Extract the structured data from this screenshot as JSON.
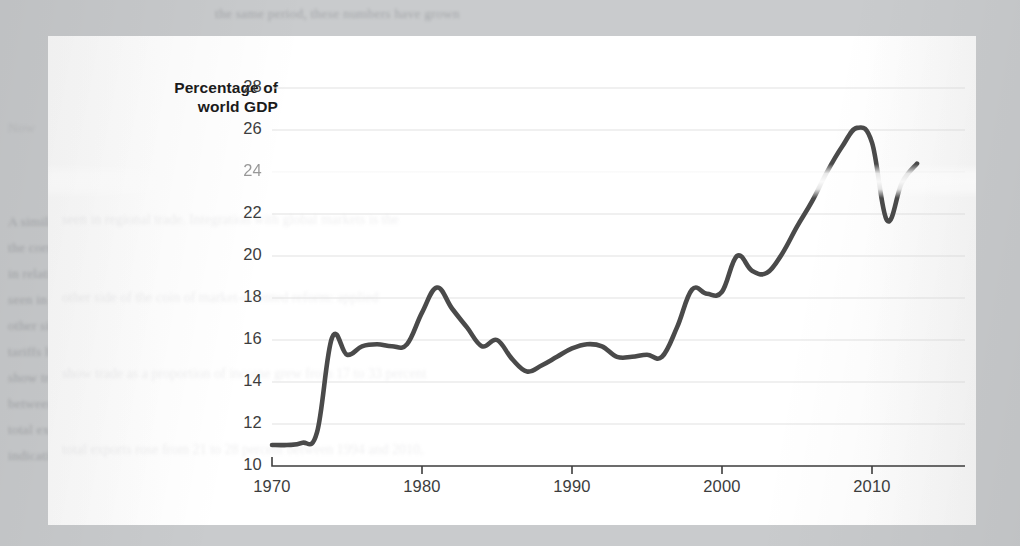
{
  "figure": {
    "y_axis_title_line1": "Percentage of",
    "y_axis_title_line2": "world GDP",
    "line_color": "#4a4a4a",
    "grid_color": "#e2e2e2",
    "axis_color": "#3d3d3d",
    "card_color": "#fdfdfd",
    "page_color": "#c9cbcd"
  },
  "page_text": {
    "line_top": "the same period, these numbers have grown",
    "line_right_1": "economies",
    "line_left_1": "Now",
    "line_body_1": "A similar story holds for",
    "line_body_2": "the corresponding figure",
    "line_body_3": "in relative terms to these",
    "line_body_4": "seen in regional trade. Integration with global markets is the",
    "line_body_5": "other side of the coin of market-oriented reform: applied",
    "line_body_6": "tariffs have fallen and export volumes have grown. Calculations",
    "line_body_7": "show trade as a proportion of income grew from 17 to 33 percent",
    "line_body_8": "between 1990 and 2010, while the share of intermediate inputs in",
    "line_body_9": "total exports rose from 21 to 28 percent between 1994 and 2010,",
    "line_body_10": "indicating much greater integration into global value chains."
  },
  "chart_data": {
    "type": "line",
    "title": "",
    "xlabel": "",
    "ylabel": "Percentage of world GDP",
    "xlim": [
      1970,
      2013
    ],
    "ylim": [
      10,
      28
    ],
    "yticks": [
      10,
      12,
      14,
      16,
      18,
      20,
      22,
      24,
      26,
      28
    ],
    "xticks": [
      1970,
      1980,
      1990,
      2000,
      2010
    ],
    "ytick_labels": [
      "10",
      "12",
      "14",
      "16",
      "18",
      "20",
      "22",
      "24",
      "26",
      "28"
    ],
    "xtick_labels": [
      "1970",
      "1980",
      "1990",
      "2000",
      "2010"
    ],
    "grid": "horizontal",
    "legend": "none",
    "series": [
      {
        "name": "Percentage of world GDP",
        "x": [
          1970,
          1971,
          1972,
          1973,
          1974,
          1975,
          1976,
          1977,
          1978,
          1979,
          1980,
          1981,
          1982,
          1983,
          1984,
          1985,
          1986,
          1987,
          1988,
          1989,
          1990,
          1991,
          1992,
          1993,
          1994,
          1995,
          1996,
          1997,
          1998,
          1999,
          2000,
          2001,
          2002,
          2003,
          2004,
          2005,
          2006,
          2007,
          2008,
          2009,
          2010,
          2011,
          2012,
          2013
        ],
        "values": [
          11.0,
          11.0,
          11.1,
          11.6,
          16.1,
          15.3,
          15.7,
          15.8,
          15.7,
          15.8,
          17.3,
          18.5,
          17.5,
          16.6,
          15.7,
          16.0,
          15.1,
          14.5,
          14.8,
          15.2,
          15.6,
          15.8,
          15.7,
          15.2,
          15.2,
          15.3,
          15.2,
          16.6,
          18.4,
          18.2,
          18.3,
          20.0,
          19.3,
          19.2,
          20.1,
          21.4,
          22.6,
          24.0,
          25.2,
          26.1,
          25.4,
          21.7,
          23.5,
          24.4
        ]
      }
    ]
  }
}
